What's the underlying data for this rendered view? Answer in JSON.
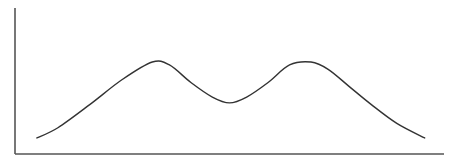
{
  "chart_data": {
    "type": "line",
    "title": "",
    "xlabel": "",
    "ylabel": "",
    "xlim": [
      0,
      10
    ],
    "ylim": [
      0,
      10
    ],
    "grid": false,
    "legend": "none",
    "x_ticks": [],
    "y_ticks": [],
    "series": [
      {
        "name": "bimodal-curve",
        "color": "#333333",
        "x": [
          0.51,
          1.0,
          1.75,
          2.5,
          3.2,
          3.6,
          4.1,
          4.6,
          5.0,
          5.4,
          5.9,
          6.4,
          6.9,
          7.3,
          7.8,
          8.3,
          8.9,
          9.55
        ],
        "y": [
          1.1,
          1.8,
          3.4,
          5.1,
          6.3,
          6.1,
          4.9,
          3.9,
          3.5,
          3.9,
          4.9,
          6.1,
          6.3,
          5.8,
          4.6,
          3.4,
          2.1,
          1.1
        ]
      }
    ]
  },
  "colors": {
    "axis": "#555555",
    "line": "#333333",
    "background": "#ffffff"
  }
}
